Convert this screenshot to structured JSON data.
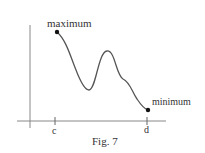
{
  "figure": {
    "caption": "Fig. 7",
    "labels": {
      "maximum": "maximum",
      "minimum": "minimum",
      "tick_c": "c",
      "tick_d": "d"
    },
    "colors": {
      "line": "#555555",
      "axis": "#777777",
      "point": "#111111",
      "text": "#333333"
    }
  }
}
